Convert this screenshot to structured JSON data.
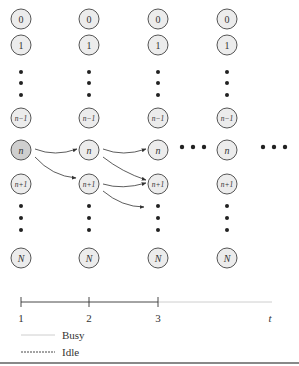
{
  "diagram": {
    "columns": [
      {
        "x": 21,
        "time": "1"
      },
      {
        "x": 89,
        "time": "2"
      },
      {
        "x": 158,
        "time": "3"
      },
      {
        "x": 227,
        "time": ""
      }
    ],
    "states": [
      {
        "label": "0",
        "y": 19,
        "italic": false,
        "small": false
      },
      {
        "label": "1",
        "y": 45,
        "italic": false,
        "small": false
      },
      {
        "label": "n−1",
        "y": 118,
        "italic": true,
        "small": true
      },
      {
        "label": "n",
        "y": 150,
        "italic": true,
        "small": false
      },
      {
        "label": "n+1",
        "y": 184,
        "italic": true,
        "small": true
      },
      {
        "label": "N",
        "y": 258,
        "italic": true,
        "small": false
      }
    ],
    "highlighted_state": {
      "column": 0,
      "state": "n"
    },
    "transitions": [
      {
        "from": "col1:n",
        "to": "col2:n"
      },
      {
        "from": "col1:n",
        "to": "col2:n+1"
      },
      {
        "from": "col2:n",
        "to": "col3:n"
      },
      {
        "from": "col2:n",
        "to": "col3:n+1"
      },
      {
        "from": "col2:n+1",
        "to": "col3:n+1"
      },
      {
        "from": "col2:n+1",
        "to": "col3:n+2"
      }
    ],
    "ellipsis": "• • •"
  },
  "timeline": {
    "ticks": [
      "1",
      "2",
      "3"
    ],
    "end_label": "t"
  },
  "legend": {
    "items": [
      {
        "label": "Busy",
        "style": "solid-light"
      },
      {
        "label": "Idle",
        "style": "dashed-dark"
      }
    ]
  },
  "colors": {
    "node_fill": "#ececec",
    "node_highlight": "#cfcfcf",
    "node_stroke": "#555555",
    "busy_line": "#c8c8c8",
    "idle_line": "#333333"
  }
}
